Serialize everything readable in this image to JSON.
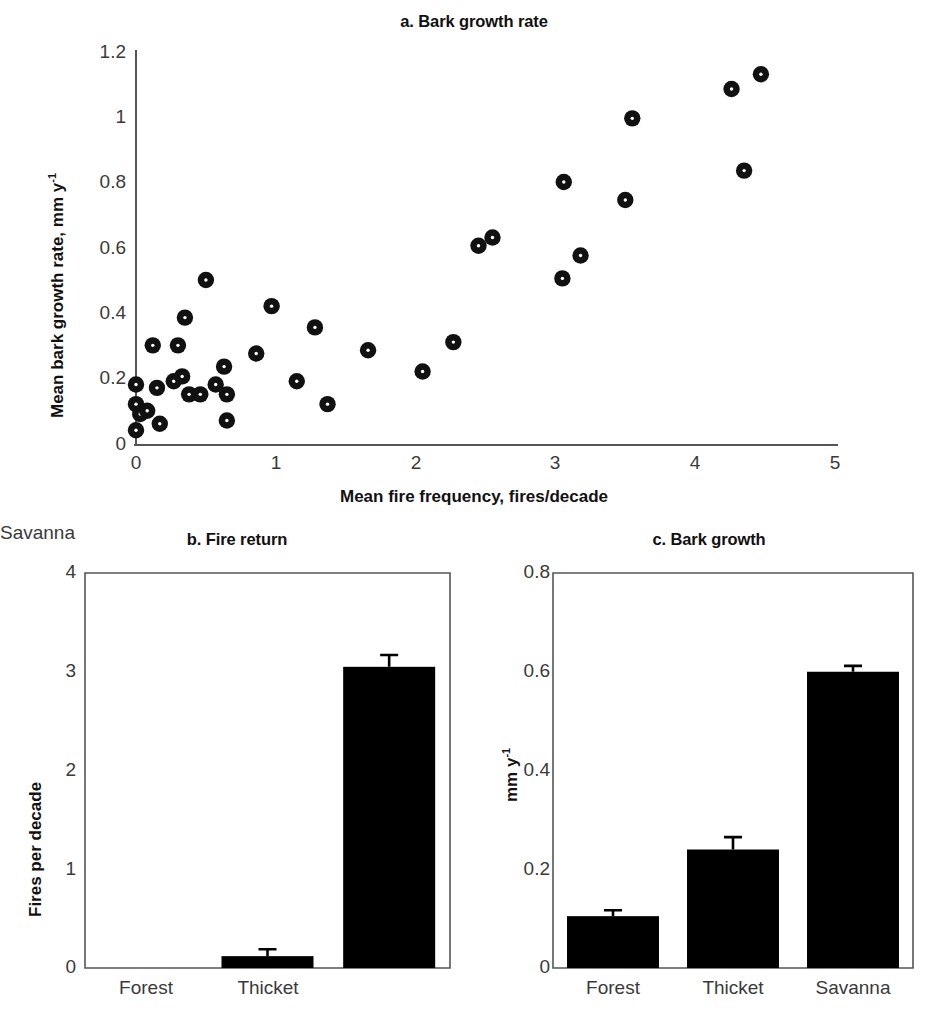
{
  "figure": {
    "background": "#ffffff",
    "marker_color": "#111111",
    "bar_color": "#000000",
    "axis_color": "#555555"
  },
  "panel_a": {
    "label": "a. Bark growth rate",
    "xlabel": "Mean fire frequency, fires/decade",
    "ylabel_main": "Mean bark growth rate, mm y",
    "ylabel_sup": "-1",
    "x_ticks": [
      "0",
      "1",
      "2",
      "3",
      "4",
      "5"
    ],
    "y_ticks": [
      "0",
      "0.2",
      "0.4",
      "0.6",
      "0.8",
      "1",
      "1.2"
    ]
  },
  "panel_b": {
    "label": "b. Fire return",
    "ylabel": "Fires per decade",
    "y_ticks": [
      "0",
      "1",
      "2",
      "3",
      "4"
    ],
    "categories": [
      "Forest",
      "Thicket",
      "Savanna"
    ]
  },
  "panel_c": {
    "label": "c. Bark growth",
    "ylabel_main": "mm y",
    "ylabel_sup": "-1",
    "y_ticks": [
      "0",
      "0.2",
      "0.4",
      "0.6",
      "0.8"
    ],
    "categories": [
      "Forest",
      "Thicket",
      "Savanna"
    ]
  },
  "chart_data": [
    {
      "type": "scatter",
      "panel": "a",
      "title": "a. Bark growth rate",
      "xlabel": "Mean fire frequency, fires/decade",
      "ylabel": "Mean bark growth rate, mm y^-1",
      "xlim": [
        0,
        5
      ],
      "ylim": [
        0,
        1.2
      ],
      "xticks": [
        0,
        1,
        2,
        3,
        4,
        5
      ],
      "yticks": [
        0,
        0.2,
        0.4,
        0.6,
        0.8,
        1,
        1.2
      ],
      "grid": false,
      "legend": "none",
      "marker": "filled-circle-with-white-center",
      "points": [
        [
          0.0,
          0.045
        ],
        [
          0.0,
          0.125
        ],
        [
          0.0,
          0.185
        ],
        [
          0.03,
          0.095
        ],
        [
          0.08,
          0.105
        ],
        [
          0.12,
          0.305
        ],
        [
          0.15,
          0.175
        ],
        [
          0.17,
          0.065
        ],
        [
          0.27,
          0.195
        ],
        [
          0.3,
          0.305
        ],
        [
          0.33,
          0.21
        ],
        [
          0.35,
          0.39
        ],
        [
          0.38,
          0.155
        ],
        [
          0.46,
          0.155
        ],
        [
          0.5,
          0.505
        ],
        [
          0.57,
          0.185
        ],
        [
          0.63,
          0.24
        ],
        [
          0.65,
          0.155
        ],
        [
          0.65,
          0.075
        ],
        [
          0.86,
          0.28
        ],
        [
          0.97,
          0.425
        ],
        [
          1.15,
          0.195
        ],
        [
          1.28,
          0.36
        ],
        [
          1.37,
          0.125
        ],
        [
          1.66,
          0.29
        ],
        [
          2.05,
          0.225
        ],
        [
          2.27,
          0.315
        ],
        [
          2.45,
          0.61
        ],
        [
          2.55,
          0.635
        ],
        [
          3.05,
          0.51
        ],
        [
          3.06,
          0.805
        ],
        [
          3.18,
          0.58
        ],
        [
          3.5,
          0.75
        ],
        [
          3.55,
          1.0
        ],
        [
          4.26,
          1.09
        ],
        [
          4.35,
          0.84
        ],
        [
          4.47,
          1.135
        ]
      ]
    },
    {
      "type": "bar",
      "panel": "b",
      "title": "b. Fire return",
      "xlabel": "",
      "ylabel": "Fires per decade",
      "categories": [
        "Forest",
        "Thicket",
        "Savanna"
      ],
      "values": [
        0.0,
        0.12,
        3.05
      ],
      "errors": [
        0.0,
        0.07,
        0.12
      ],
      "ylim": [
        0,
        4
      ],
      "yticks": [
        0,
        1,
        2,
        3,
        4
      ],
      "grid": false,
      "legend": "none"
    },
    {
      "type": "bar",
      "panel": "c",
      "title": "c. Bark growth",
      "xlabel": "",
      "ylabel": "mm y^-1",
      "categories": [
        "Forest",
        "Thicket",
        "Savanna"
      ],
      "values": [
        0.105,
        0.24,
        0.6
      ],
      "errors": [
        0.012,
        0.025,
        0.012
      ],
      "ylim": [
        0,
        0.8
      ],
      "yticks": [
        0,
        0.2,
        0.4,
        0.6,
        0.8
      ],
      "grid": false,
      "legend": "none"
    }
  ]
}
